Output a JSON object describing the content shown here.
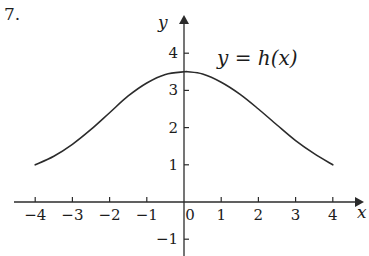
{
  "problem": {
    "number": "7."
  },
  "axes": {
    "y_label": "y",
    "x_label": "x",
    "origin_px": {
      "x": 184,
      "y": 202
    },
    "unit_px": 37.2,
    "x_ticks": [
      {
        "value": -4,
        "label": "−4"
      },
      {
        "value": -3,
        "label": "−3"
      },
      {
        "value": -2,
        "label": "−2"
      },
      {
        "value": -1,
        "label": "−1"
      },
      {
        "value": 0,
        "label": "0"
      },
      {
        "value": 1,
        "label": "1"
      },
      {
        "value": 2,
        "label": "2"
      },
      {
        "value": 3,
        "label": "3"
      },
      {
        "value": 4,
        "label": "4"
      }
    ],
    "y_ticks": [
      {
        "value": 4,
        "label": "4"
      },
      {
        "value": 3,
        "label": "3"
      },
      {
        "value": 2,
        "label": "2"
      },
      {
        "value": 1,
        "label": "1"
      },
      {
        "value": -1,
        "label": "−1"
      }
    ]
  },
  "curve": {
    "equation_label": "y = h(x)",
    "color": "#2b2b2b",
    "stroke_width": 1.6
  },
  "chart_data": {
    "type": "line",
    "title": "",
    "subtitle": "",
    "xlabel": "x",
    "ylabel": "y",
    "xlim": [
      -4.6,
      4.6
    ],
    "ylim": [
      -1.4,
      4.4
    ],
    "grid": false,
    "legend": "none",
    "annotations": [
      {
        "text": "y = h(x)",
        "x": 1.0,
        "y": 3.9
      },
      {
        "text": "7.",
        "x": -4.8,
        "y": 4.4
      }
    ],
    "series": [
      {
        "name": "y = h(x)",
        "x": [
          -4.0,
          -3.5,
          -3.0,
          -2.5,
          -2.0,
          -1.5,
          -1.0,
          -0.5,
          0.0,
          0.1,
          0.5,
          1.0,
          1.5,
          2.0,
          2.5,
          3.0,
          3.5,
          4.0
        ],
        "y": [
          1.0,
          1.23,
          1.55,
          1.95,
          2.4,
          2.85,
          3.2,
          3.43,
          3.5,
          3.5,
          3.44,
          3.22,
          2.9,
          2.5,
          2.07,
          1.65,
          1.3,
          1.0
        ]
      }
    ]
  }
}
